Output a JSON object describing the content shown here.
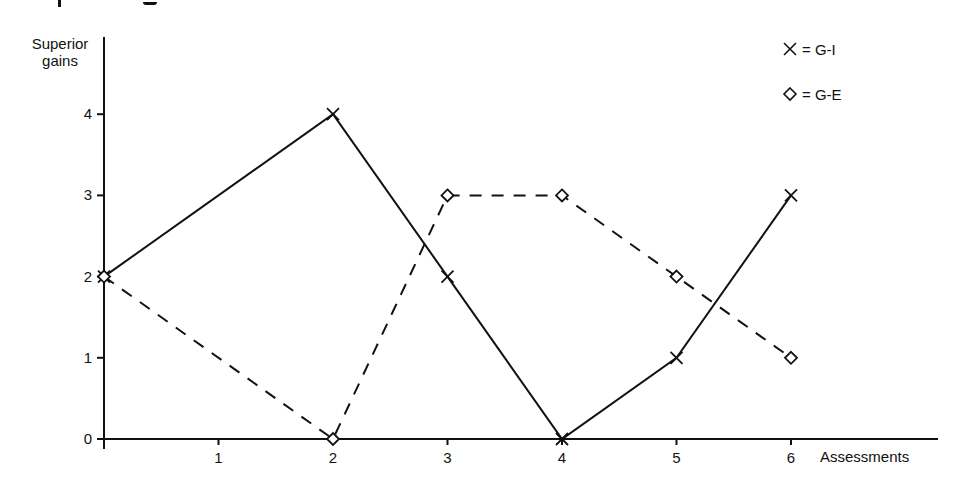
{
  "chart_data": {
    "type": "line",
    "title": "",
    "xlabel": "Assessments",
    "ylabel": "Superior gains",
    "x": [
      0,
      2,
      3,
      4,
      5,
      6
    ],
    "x_ticks": [
      "1",
      "2",
      "3",
      "4",
      "5",
      "6"
    ],
    "y_ticks": [
      "0",
      "1",
      "2",
      "3",
      "4"
    ],
    "xlim": [
      0,
      7.3
    ],
    "ylim": [
      0,
      5
    ],
    "grid": false,
    "legend_position": "top-right",
    "series": [
      {
        "name": "G-I",
        "marker": "x",
        "line": "solid",
        "values": [
          2,
          4,
          2,
          0,
          1,
          3
        ]
      },
      {
        "name": "G-E",
        "marker": "diamond",
        "line": "dashed",
        "values": [
          2,
          0,
          3,
          3,
          2,
          1
        ]
      }
    ]
  },
  "axes": {
    "ylabel_line1": "Superior",
    "ylabel_line2": "gains",
    "xlabel": "Assessments"
  },
  "legend": {
    "gi_label": "= G-I",
    "ge_label": "= G-E"
  }
}
